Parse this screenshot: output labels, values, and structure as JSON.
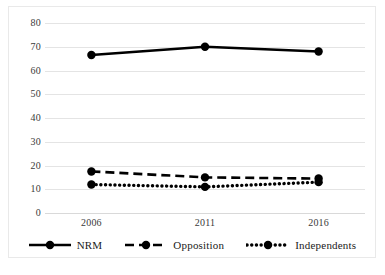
{
  "chart_data": {
    "type": "line",
    "title": "",
    "subtitle": "",
    "xlabel": "",
    "ylabel": "",
    "categories": [
      "2006",
      "2011",
      "2016"
    ],
    "x": [
      2006,
      2011,
      2016
    ],
    "series": [
      {
        "name": "NRM",
        "values": [
          66.5,
          70,
          68
        ],
        "style": "solid",
        "marker": "circle",
        "color": "#000000"
      },
      {
        "name": "Opposition",
        "values": [
          17.5,
          15,
          14.5
        ],
        "style": "dashed",
        "marker": "circle",
        "color": "#000000"
      },
      {
        "name": "Independents",
        "values": [
          12,
          11,
          13
        ],
        "style": "dotted",
        "marker": "circle",
        "color": "#000000"
      }
    ],
    "ylim": [
      0,
      80
    ],
    "yticks": [
      0,
      10,
      20,
      30,
      40,
      50,
      60,
      70,
      80
    ],
    "ytick_labels": [
      "0",
      "10",
      "20",
      "30",
      "40",
      "50",
      "60",
      "70",
      "80"
    ],
    "xtick_labels": [
      "2006",
      "2011",
      "2016"
    ],
    "grid": "horizontal",
    "legend_position": "bottom",
    "legend_entries": [
      "NRM",
      "Opposition",
      "Independents"
    ],
    "annotations": []
  },
  "figure": {
    "border_color": "#e9e9e9",
    "grid_color": "#e4e4e4",
    "background": "#ffffff",
    "ink_color": "#000000"
  }
}
